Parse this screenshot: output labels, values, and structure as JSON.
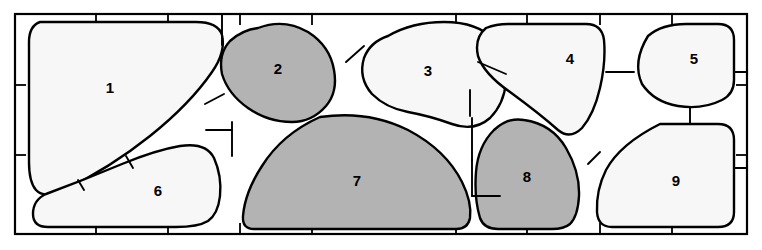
{
  "figure": {
    "kind": "grain-microstructure-schematic",
    "frame": {
      "left": 15,
      "top": 14,
      "right": 747,
      "bottom": 234,
      "stroke_color": "#000000",
      "stroke_width": 2.2,
      "fill_color": "#ffffff",
      "tick_color": "#000000",
      "tick_width": 1.8,
      "top_ticks_x": [
        96,
        168,
        240,
        312,
        456,
        527,
        600,
        672
      ],
      "bottom_ticks_x": [
        96,
        168,
        240,
        312,
        456,
        527,
        600,
        672
      ],
      "left_ticks_y": [
        85,
        155
      ],
      "right_ticks_y": [
        85,
        155
      ]
    },
    "palette": {
      "shaded_fill": "#b3b3b3",
      "light_fill": "#f7f7f7",
      "background": "#ffffff",
      "outline": "#000000",
      "label_color": "#000000"
    },
    "grains": [
      {
        "id": 1,
        "label": "1",
        "shade": "light",
        "fill": "#f7f7f7",
        "label_x": 110,
        "label_y": 89,
        "path": "M 40 22 L 196 22 Q 218 22 222 35 Q 226 52 212 72 Q 190 104 150 136 Q 110 168 64 190 Q 44 199 36 190 Q 29 182 29 162 L 29 42 Q 29 26 40 22 Z"
      },
      {
        "id": 2,
        "label": "2",
        "shade": "shaded",
        "fill": "#b3b3b3",
        "label_x": 278,
        "label_y": 70,
        "path": "M 258 28 Q 284 18 308 32 Q 330 46 334 70 Q 338 92 326 106 Q 312 122 292 122 Q 268 122 248 108 Q 228 94 222 74 Q 218 54 230 41 Q 242 30 258 28 Z"
      },
      {
        "id": 3,
        "label": "3",
        "shade": "light",
        "fill": "#f7f7f7",
        "label_x": 428,
        "label_y": 72,
        "path": "M 388 36 Q 412 22 444 22 Q 478 22 494 40 Q 508 56 506 82 Q 504 104 490 118 Q 474 132 452 124 Q 430 116 408 112 Q 386 108 372 94 Q 358 78 364 58 Q 370 42 388 36 Z"
      },
      {
        "id": 4,
        "label": "4",
        "shade": "light",
        "fill": "#f7f7f7",
        "label_x": 570,
        "label_y": 60,
        "path": "M 508 24 L 586 24 Q 602 24 604 40 Q 606 62 600 88 Q 594 114 582 128 Q 570 140 558 130 Q 540 114 510 92 Q 484 74 478 56 Q 474 38 486 28 Q 496 24 508 24 Z"
      },
      {
        "id": 5,
        "label": "5",
        "shade": "light",
        "fill": "#f7f7f7",
        "label_x": 694,
        "label_y": 60,
        "path": "M 648 36 Q 662 24 686 24 L 718 24 Q 734 24 734 40 L 734 80 Q 734 94 722 100 Q 702 110 678 106 Q 654 102 642 84 Q 632 62 648 36 Z"
      },
      {
        "id": 6,
        "label": "6",
        "shade": "light",
        "fill": "#f7f7f7",
        "label_x": 158,
        "label_y": 192,
        "path": "M 180 146 Q 206 142 214 158 Q 222 176 220 196 Q 218 214 208 221 Q 198 227 176 227 L 48 227 Q 33 227 33 214 Q 33 200 46 194 Q 84 180 122 164 Q 156 150 180 146 Z"
      },
      {
        "id": 7,
        "label": "7",
        "shade": "shaded",
        "fill": "#b3b3b3",
        "label_x": 357,
        "label_y": 182,
        "path": "M 320 117 Q 368 110 408 130 Q 446 150 462 182 Q 472 202 470 218 Q 468 229 456 229 L 254 229 Q 242 229 243 216 Q 245 192 262 166 Q 282 134 320 117 Z"
      },
      {
        "id": 8,
        "label": "8",
        "shade": "shaded",
        "fill": "#b3b3b3",
        "label_x": 527,
        "label_y": 178,
        "path": "M 524 120 Q 552 124 566 148 Q 580 172 579 196 Q 578 216 570 224 Q 564 229 552 229 L 498 229 Q 484 229 480 218 Q 474 198 476 172 Q 478 146 494 130 Q 508 117 524 120 Z"
      },
      {
        "id": 9,
        "label": "9",
        "shade": "light",
        "fill": "#f7f7f7",
        "label_x": 676,
        "label_y": 182,
        "path": "M 660 124 L 718 124 Q 734 124 734 140 L 734 212 Q 734 227 718 227 L 612 227 Q 598 227 597 212 Q 596 190 606 170 Q 620 144 660 124 Z"
      }
    ],
    "junction_segments": [
      {
        "name": "junction-1-2-top",
        "x1": 222,
        "y1": 45,
        "x2": 222,
        "y2": 14
      },
      {
        "name": "junction-2-3-top",
        "x1": 346,
        "y1": 62,
        "x2": 364,
        "y2": 46
      },
      {
        "name": "junction-1-2-mid",
        "x1": 205,
        "y1": 104,
        "x2": 224,
        "y2": 94
      },
      {
        "name": "junction-2-7",
        "x1": 232,
        "y1": 122,
        "x2": 232,
        "y2": 156
      },
      {
        "name": "junction-2-7-b",
        "x1": 232,
        "y1": 130,
        "x2": 206,
        "y2": 130
      },
      {
        "name": "junction-3-7",
        "x1": 470,
        "y1": 116,
        "x2": 470,
        "y2": 90
      },
      {
        "name": "junction-3-4",
        "x1": 478,
        "y1": 62,
        "x2": 506,
        "y2": 74
      },
      {
        "name": "junction-4-5",
        "x1": 606,
        "y1": 72,
        "x2": 634,
        "y2": 72
      },
      {
        "name": "junction-5-9",
        "x1": 690,
        "y1": 108,
        "x2": 690,
        "y2": 124
      },
      {
        "name": "junction-7-8",
        "x1": 472,
        "y1": 160,
        "x2": 472,
        "y2": 196
      },
      {
        "name": "junction-7-8-b",
        "x1": 472,
        "y1": 196,
        "x2": 500,
        "y2": 196
      },
      {
        "name": "junction-8-9",
        "x1": 588,
        "y1": 164,
        "x2": 600,
        "y2": 152
      },
      {
        "name": "junction-1-6",
        "x1": 133,
        "y1": 168,
        "x2": 126,
        "y2": 156
      },
      {
        "name": "junction-1-6-b",
        "x1": 84,
        "y1": 190,
        "x2": 78,
        "y2": 180
      },
      {
        "name": "junction-4-8-stem",
        "x1": 472,
        "y1": 118,
        "x2": 472,
        "y2": 160
      },
      {
        "name": "junction-9-right",
        "x1": 734,
        "y1": 168,
        "x2": 747,
        "y2": 168
      },
      {
        "name": "junction-5-right",
        "x1": 734,
        "y1": 72,
        "x2": 747,
        "y2": 72
      }
    ]
  }
}
